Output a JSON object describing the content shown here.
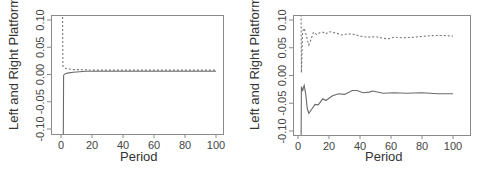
{
  "chart_data": [
    {
      "type": "line",
      "title": "",
      "xlabel": "Period",
      "ylabel": "Left and Right Platforms",
      "xlim": [
        0,
        100
      ],
      "ylim": [
        -0.105,
        0.105
      ],
      "xticks": [
        0,
        20,
        40,
        60,
        80,
        100
      ],
      "xtick_labels": [
        "0",
        "20",
        "40",
        "60",
        "80",
        "100"
      ],
      "yticks": [
        -0.1,
        -0.05,
        0.0,
        0.05,
        0.1
      ],
      "ytick_labels": [
        "-0.10",
        "-0.05",
        "0.00",
        "0.05",
        "0.10"
      ],
      "grid": false,
      "legend": null,
      "series": [
        {
          "name": "Right platform",
          "style": "dashed",
          "x": [
            1,
            1.2,
            2,
            3,
            5,
            8,
            12,
            20,
            30,
            50,
            70,
            100
          ],
          "y": [
            0.12,
            0.015,
            0.013,
            0.011,
            0.01,
            0.009,
            0.009,
            0.008,
            0.008,
            0.008,
            0.008,
            0.008
          ]
        },
        {
          "name": "Left platform",
          "style": "solid",
          "x": [
            1.5,
            1.7,
            2,
            3,
            5,
            8,
            12,
            16,
            20,
            30,
            50,
            70,
            100
          ],
          "y": [
            -0.12,
            -0.002,
            0.0,
            0.002,
            0.003,
            0.004,
            0.005,
            0.006,
            0.006,
            0.006,
            0.006,
            0.006,
            0.006
          ]
        }
      ]
    },
    {
      "type": "line",
      "title": "",
      "xlabel": "Period",
      "ylabel": "Left and Right Platforms",
      "xlim": [
        0,
        100
      ],
      "ylim": [
        -0.105,
        0.105
      ],
      "xticks": [
        0,
        20,
        40,
        60,
        80,
        100
      ],
      "xtick_labels": [
        "0",
        "20",
        "40",
        "60",
        "80",
        "100"
      ],
      "yticks": [
        -0.1,
        -0.05,
        0.0,
        0.05,
        0.1
      ],
      "ytick_labels": [
        "-0.10",
        "-0.05",
        "0.00",
        "0.05",
        "0.10"
      ],
      "grid": false,
      "legend": null,
      "series": [
        {
          "name": "Right platform",
          "style": "dashed",
          "x": [
            2,
            2.2,
            3,
            4,
            5,
            7,
            8,
            10,
            12,
            14,
            16,
            18,
            20,
            22,
            25,
            28,
            32,
            36,
            40,
            45,
            50,
            55,
            58,
            62,
            68,
            75,
            82,
            88,
            94,
            100
          ],
          "y": [
            0.11,
            0.005,
            0.08,
            0.085,
            0.075,
            0.055,
            0.062,
            0.078,
            0.074,
            0.077,
            0.078,
            0.075,
            0.079,
            0.078,
            0.076,
            0.073,
            0.075,
            0.074,
            0.071,
            0.069,
            0.07,
            0.067,
            0.066,
            0.069,
            0.068,
            0.069,
            0.071,
            0.072,
            0.072,
            0.071
          ]
        },
        {
          "name": "Left platform",
          "style": "solid",
          "x": [
            2,
            2.2,
            3,
            3.5,
            4,
            5,
            6,
            7,
            9,
            11,
            13,
            16,
            18,
            22,
            26,
            30,
            35,
            38,
            42,
            46,
            48,
            55,
            62,
            70,
            80,
            90,
            100
          ],
          "y": [
            -0.12,
            -0.02,
            -0.028,
            -0.022,
            -0.018,
            -0.035,
            -0.06,
            -0.068,
            -0.06,
            -0.052,
            -0.053,
            -0.042,
            -0.045,
            -0.037,
            -0.033,
            -0.034,
            -0.027,
            -0.027,
            -0.031,
            -0.03,
            -0.028,
            -0.032,
            -0.031,
            -0.032,
            -0.031,
            -0.033,
            -0.033
          ]
        }
      ]
    }
  ]
}
